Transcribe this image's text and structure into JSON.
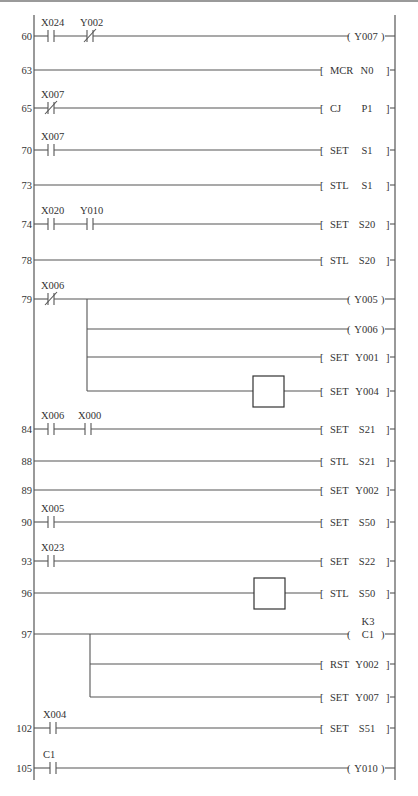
{
  "diagram": {
    "type": "ladder-diagram",
    "left_rail_x": 34,
    "right_rail_x": 395,
    "rail_top": 15,
    "rail_bottom": 780,
    "colors": {
      "line": "#555555",
      "text": "#333333",
      "background": "#ffffff"
    },
    "rungs": [
      {
        "step": "60",
        "y": 36,
        "contacts": [
          {
            "label": "X024",
            "type": "NO",
            "x": 48
          },
          {
            "label": "Y002",
            "type": "NC",
            "x": 87
          }
        ],
        "output": {
          "kind": "coil",
          "op": "",
          "operand": "Y007"
        }
      },
      {
        "step": "63",
        "y": 70,
        "contacts": [],
        "output": {
          "kind": "instr",
          "op": "MCR",
          "operand": "N0"
        }
      },
      {
        "step": "65",
        "y": 108,
        "contacts": [
          {
            "label": "X007",
            "type": "NC",
            "x": 48
          }
        ],
        "output": {
          "kind": "instr",
          "op": "CJ",
          "operand": "P1"
        }
      },
      {
        "step": "70",
        "y": 150,
        "contacts": [
          {
            "label": "X007",
            "type": "NO",
            "x": 48
          }
        ],
        "output": {
          "kind": "instr",
          "op": "SET",
          "operand": "S1"
        }
      },
      {
        "step": "73",
        "y": 185,
        "contacts": [],
        "output": {
          "kind": "instr",
          "op": "STL",
          "operand": "S1"
        }
      },
      {
        "step": "74",
        "y": 224,
        "contacts": [
          {
            "label": "X020",
            "type": "NO",
            "x": 48
          },
          {
            "label": "Y010",
            "type": "NO",
            "x": 87
          }
        ],
        "output": {
          "kind": "instr",
          "op": "SET",
          "operand": "S20"
        }
      },
      {
        "step": "78",
        "y": 260,
        "contacts": [],
        "output": {
          "kind": "instr",
          "op": "STL",
          "operand": "S20"
        }
      },
      {
        "step": "79",
        "y": 299,
        "contacts": [
          {
            "label": "X006",
            "type": "NC",
            "x": 48
          }
        ],
        "branch_x": 87,
        "outputs": [
          {
            "y": 299,
            "kind": "coil",
            "op": "",
            "operand": "Y005"
          },
          {
            "y": 329,
            "kind": "coil",
            "op": "",
            "operand": "Y006"
          },
          {
            "y": 357,
            "kind": "instr",
            "op": "SET",
            "operand": "Y001"
          },
          {
            "y": 391,
            "kind": "instr",
            "op": "SET",
            "operand": "Y004",
            "blank_box": true
          }
        ]
      },
      {
        "step": "84",
        "y": 429,
        "contacts": [
          {
            "label": "X006",
            "type": "NO",
            "x": 48
          },
          {
            "label": "X000",
            "type": "NO",
            "x": 85
          }
        ],
        "output": {
          "kind": "instr",
          "op": "SET",
          "operand": "S21"
        }
      },
      {
        "step": "88",
        "y": 461,
        "contacts": [],
        "output": {
          "kind": "instr",
          "op": "STL",
          "operand": "S21"
        }
      },
      {
        "step": "89",
        "y": 490,
        "contacts": [],
        "output": {
          "kind": "instr",
          "op": "SET",
          "operand": "Y002"
        }
      },
      {
        "step": "90",
        "y": 522,
        "contacts": [
          {
            "label": "X005",
            "type": "NO",
            "x": 48
          }
        ],
        "output": {
          "kind": "instr",
          "op": "SET",
          "operand": "S50"
        }
      },
      {
        "step": "93",
        "y": 561,
        "contacts": [
          {
            "label": "X023",
            "type": "NO",
            "x": 48
          }
        ],
        "output": {
          "kind": "instr",
          "op": "SET",
          "operand": "S22"
        }
      },
      {
        "step": "96",
        "y": 593,
        "contacts": [],
        "output": {
          "kind": "instr",
          "op": "STL",
          "operand": "S50",
          "blank_box": true
        }
      },
      {
        "step": "97",
        "y": 634,
        "contacts": [],
        "branch_x": 90,
        "outputs": [
          {
            "y": 634,
            "kind": "coil",
            "op": "",
            "operand": "C1",
            "preset": "K3"
          },
          {
            "y": 664,
            "kind": "instr",
            "op": "RST",
            "operand": "Y002"
          },
          {
            "y": 697,
            "kind": "instr",
            "op": "SET",
            "operand": "Y007"
          }
        ]
      },
      {
        "step": "102",
        "y": 728,
        "contacts": [
          {
            "label": "X004",
            "type": "NO",
            "x": 50
          }
        ],
        "output": {
          "kind": "instr",
          "op": "SET",
          "operand": "S51"
        }
      },
      {
        "step": "105",
        "y": 768,
        "contacts": [
          {
            "label": "C1",
            "type": "NO",
            "x": 50
          }
        ],
        "output": {
          "kind": "coil",
          "op": "",
          "operand": "Y010"
        }
      }
    ]
  }
}
